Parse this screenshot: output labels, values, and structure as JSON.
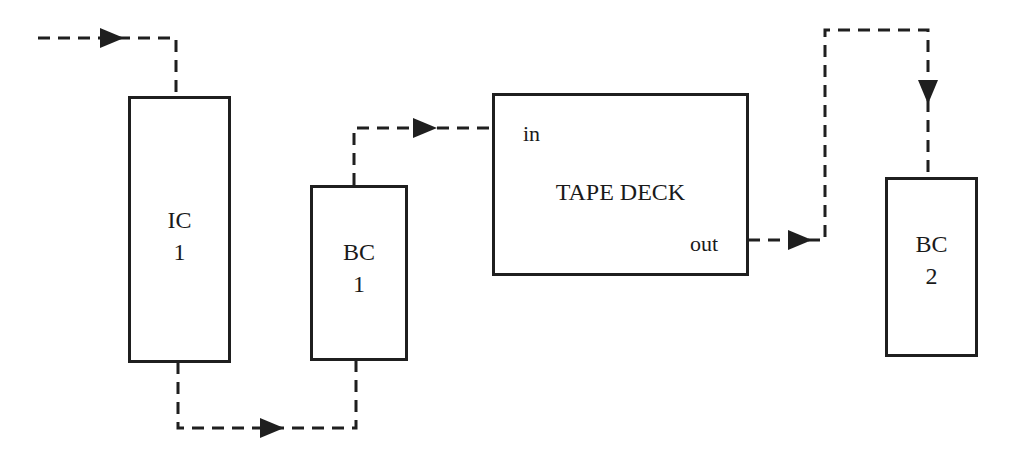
{
  "diagram": {
    "colors": {
      "stroke": "#1f1f1f",
      "background": "#ffffff"
    },
    "blocks": {
      "ic1": {
        "line1": "IC",
        "line2": "1"
      },
      "bc1": {
        "line1": "BC",
        "line2": "1"
      },
      "tape_deck": {
        "title": "TAPE DECK",
        "in_port": "in",
        "out_port": "out"
      },
      "bc2": {
        "line1": "BC",
        "line2": "2"
      }
    },
    "connections": [
      {
        "from": "input",
        "to": "IC 1",
        "style": "dashed"
      },
      {
        "from": "IC 1",
        "to": "BC 1",
        "style": "dashed"
      },
      {
        "from": "BC 1",
        "to": "TAPE DECK in",
        "style": "dashed"
      },
      {
        "from": "TAPE DECK out",
        "to": "BC 2",
        "style": "dashed"
      }
    ]
  }
}
